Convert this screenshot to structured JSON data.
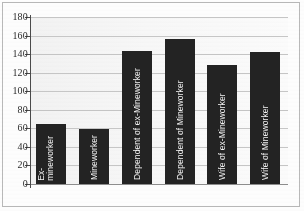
{
  "chart_data": {
    "type": "bar",
    "title": "",
    "subtitle": "",
    "xlabel": "",
    "ylabel": "",
    "categories": [
      "Ex-mineworker",
      "Mineworker",
      "Dependent of ex-Mineworker",
      "Dependent of Mineworker",
      "Wife of ex-Mineworker",
      "Wife of Mineworker"
    ],
    "values": [
      65,
      59,
      143,
      156,
      128,
      142
    ],
    "ylim": [
      0,
      180
    ],
    "yticks": [
      0,
      20,
      40,
      60,
      80,
      100,
      120,
      140,
      160,
      180
    ],
    "ytick_labels": [
      "0",
      "20",
      "40",
      "60",
      "80",
      "100",
      "120",
      "140",
      "160",
      "180"
    ],
    "grid": true,
    "legend": false,
    "legend_position": "none",
    "bar_color": "#232323",
    "plot_background": "#f6f6f6",
    "gridline_color": "#c6c6c6",
    "axis_color": "#4a4a4a",
    "label_color": "#f4f4f4",
    "labels_inside_bars": true,
    "label_rotation": -90
  }
}
